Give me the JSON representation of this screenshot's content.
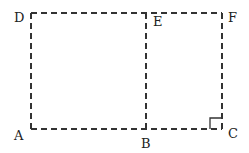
{
  "diagram": {
    "type": "geometry",
    "points": {
      "A": {
        "label": "A",
        "x": 31,
        "y": 129
      },
      "B": {
        "label": "B",
        "x": 146,
        "y": 129
      },
      "C": {
        "label": "C",
        "x": 222,
        "y": 129
      },
      "D": {
        "label": "D",
        "x": 31,
        "y": 13
      },
      "E": {
        "label": "E",
        "x": 146,
        "y": 13
      },
      "F": {
        "label": "F",
        "x": 222,
        "y": 13
      }
    },
    "segments": [
      "AB",
      "BC",
      "CF",
      "FE",
      "ED",
      "DA",
      "EB"
    ],
    "line_style": "dashed",
    "right_angle_marker": "C",
    "stroke_color": "#333333"
  }
}
